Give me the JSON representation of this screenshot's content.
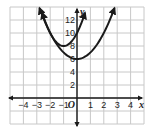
{
  "chart_data": {
    "type": "line",
    "title": "",
    "xlabel": "x",
    "ylabel": "y",
    "origin_label": "O",
    "xlim": [
      -5,
      5
    ],
    "ylim": [
      -4,
      14
    ],
    "grid": true,
    "x_tick_labels": [
      "-4",
      "-3",
      "-2",
      "-1",
      "1",
      "2",
      "3",
      "4"
    ],
    "y_tick_labels": [
      "2",
      "4",
      "6",
      "8",
      "10",
      "12"
    ],
    "series": [
      {
        "name": "wide parabola",
        "vertex": [
          0,
          6
        ],
        "equation": "y = x^2 + 6",
        "x": [
          -2.8,
          -2,
          -1,
          0,
          1,
          2,
          2.8
        ],
        "y": [
          13.84,
          10,
          7,
          6,
          7,
          10,
          13.84
        ]
      },
      {
        "name": "narrow parabola",
        "vertex": [
          -1,
          8
        ],
        "equation": "y = 2(x+1)^2 + 8",
        "x": [
          -2.6,
          -2,
          -1,
          0,
          0.6
        ],
        "y": [
          13.12,
          10,
          8,
          10,
          13.12
        ]
      }
    ]
  },
  "colors": {
    "curve": "#1a1a1a",
    "grid": "#c8c8c8",
    "axis": "#1a1a1a"
  }
}
